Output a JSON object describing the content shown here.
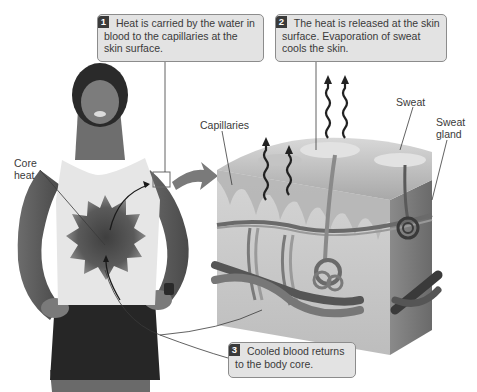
{
  "diagram": {
    "steps": [
      {
        "number": "1",
        "text": "Heat is carried by the water in blood to the capillaries at the skin surface."
      },
      {
        "number": "2",
        "text": "The heat is released at the skin surface. Evaporation of sweat cools the skin."
      },
      {
        "number": "3",
        "text": "Cooled blood returns to the body core."
      }
    ],
    "labels": {
      "core_heat": "Core heat",
      "capillaries": "Capillaries",
      "sweat": "Sweat",
      "sweat_gland": "Sweat gland"
    },
    "colors": {
      "callout_fill": "#e3e3e3",
      "callout_border": "#8c8c8c",
      "badge_fill": "#3a3a3a",
      "core_heat_dark": "#4a4a4a",
      "skin_block": "#c8c8c8"
    }
  }
}
